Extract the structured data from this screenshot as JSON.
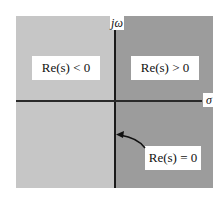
{
  "diagram": {
    "axes": {
      "vertical_label": "jω",
      "horizontal_label": "σ"
    },
    "regions": [
      {
        "id": "left-half-plane",
        "label": "Re(s) < 0",
        "color": "#c6c6c6"
      },
      {
        "id": "right-half-plane",
        "label": "Re(s) > 0",
        "color": "#9c9c9c"
      }
    ],
    "annotations": [
      {
        "id": "imaginary-axis",
        "label": "Re(s) = 0",
        "points_to": "imaginary axis"
      }
    ]
  }
}
